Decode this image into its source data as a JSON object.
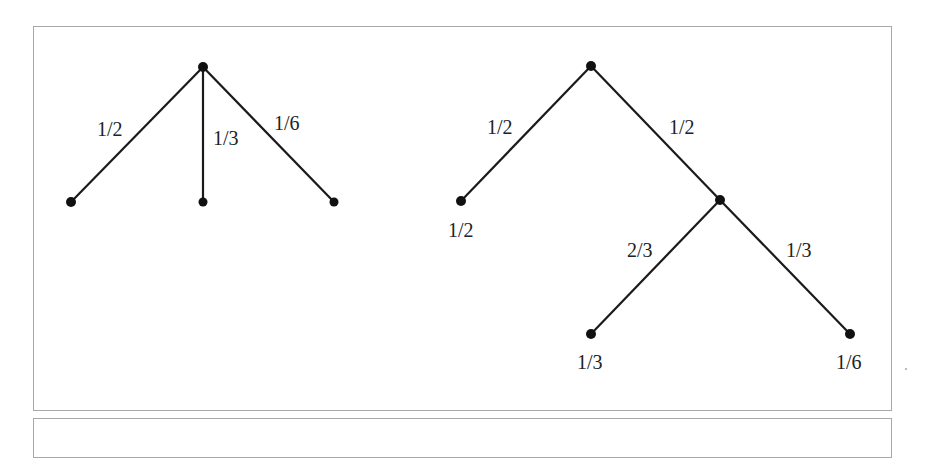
{
  "diagram": {
    "type": "probability-trees",
    "left_tree": {
      "edges": [
        {
          "from": "root",
          "to": "leaf-1",
          "label": "1/2"
        },
        {
          "from": "root",
          "to": "leaf-2",
          "label": "1/3"
        },
        {
          "from": "root",
          "to": "leaf-3",
          "label": "1/6"
        }
      ]
    },
    "right_tree": {
      "edges": [
        {
          "from": "root",
          "to": "leaf-a",
          "label": "1/2"
        },
        {
          "from": "root",
          "to": "mid",
          "label": "1/2"
        },
        {
          "from": "mid",
          "to": "leaf-b",
          "label": "2/3"
        },
        {
          "from": "mid",
          "to": "leaf-c",
          "label": "1/3"
        }
      ],
      "leaf_labels": [
        "1/2",
        "1/3",
        "1/6"
      ]
    },
    "colors": {
      "line": "#1a1a1a",
      "node": "#111111",
      "border": "#a8a8a8"
    }
  }
}
